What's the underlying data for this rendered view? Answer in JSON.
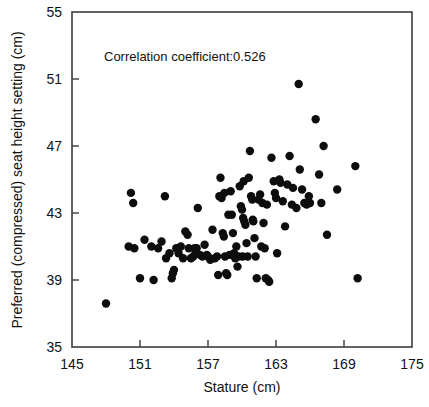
{
  "figure": {
    "annotation": "Correlation coefficient:0.526",
    "background_color": "#ffffff",
    "point_color": "#0d0d0d",
    "axis_color": "#3c3c3c"
  },
  "chart_data": {
    "type": "scatter",
    "title": "",
    "xlabel": "Stature (cm)",
    "ylabel": "Preferred (compressed) seat height setting (cm)",
    "xlim": [
      145,
      175
    ],
    "ylim": [
      35,
      55
    ],
    "xticks": [
      145,
      151,
      157,
      163,
      169,
      175
    ],
    "yticks": [
      35,
      39,
      43,
      47,
      51,
      55
    ],
    "xtick_labels": [
      "145",
      "151",
      "157",
      "163",
      "169",
      "175"
    ],
    "ytick_labels": [
      "35",
      "39",
      "43",
      "47",
      "51",
      "55"
    ],
    "grid": false,
    "legend": null,
    "annotations": [
      {
        "text": "Correlation coefficient:0.526",
        "x": 152.0,
        "y": 52.6
      }
    ],
    "correlation_coefficient": 0.526,
    "marker": {
      "shape": "circle",
      "size_px": 4.2,
      "color": "#0d0d0d"
    },
    "n_points": 118,
    "points": [
      [
        148.0,
        37.6
      ],
      [
        150.2,
        44.2
      ],
      [
        150.4,
        43.6
      ],
      [
        150.0,
        41.0
      ],
      [
        150.5,
        40.9
      ],
      [
        151.0,
        39.1
      ],
      [
        151.4,
        41.4
      ],
      [
        152.0,
        41.0
      ],
      [
        152.2,
        39.0
      ],
      [
        152.6,
        40.9
      ],
      [
        153.2,
        44.0
      ],
      [
        153.3,
        40.3
      ],
      [
        153.6,
        40.6
      ],
      [
        153.8,
        39.1
      ],
      [
        153.9,
        39.4
      ],
      [
        154.2,
        40.9
      ],
      [
        154.4,
        40.6
      ],
      [
        154.6,
        41.0
      ],
      [
        154.8,
        40.3
      ],
      [
        155.0,
        41.9
      ],
      [
        155.2,
        41.7
      ],
      [
        155.3,
        40.9
      ],
      [
        155.5,
        40.3
      ],
      [
        155.7,
        40.4
      ],
      [
        155.9,
        40.6
      ],
      [
        156.1,
        43.3
      ],
      [
        156.3,
        40.5
      ],
      [
        156.5,
        40.4
      ],
      [
        156.7,
        41.1
      ],
      [
        156.9,
        40.5
      ],
      [
        157.2,
        40.2
      ],
      [
        157.4,
        42.0
      ],
      [
        157.6,
        40.3
      ],
      [
        157.8,
        40.4
      ],
      [
        157.9,
        39.3
      ],
      [
        158.0,
        44.0
      ],
      [
        158.1,
        45.1
      ],
      [
        158.2,
        43.9
      ],
      [
        158.3,
        41.8
      ],
      [
        158.4,
        41.6
      ],
      [
        158.5,
        40.4
      ],
      [
        158.6,
        39.4
      ],
      [
        158.7,
        39.3
      ],
      [
        158.9,
        40.5
      ],
      [
        159.0,
        44.3
      ],
      [
        159.1,
        42.9
      ],
      [
        159.2,
        41.8
      ],
      [
        159.3,
        40.6
      ],
      [
        159.4,
        40.3
      ],
      [
        159.6,
        39.8
      ],
      [
        159.8,
        44.6
      ],
      [
        159.9,
        43.4
      ],
      [
        160.0,
        43.2
      ],
      [
        160.1,
        42.7
      ],
      [
        160.2,
        42.5
      ],
      [
        160.3,
        42.3
      ],
      [
        160.4,
        41.2
      ],
      [
        160.5,
        40.4
      ],
      [
        160.6,
        45.1
      ],
      [
        160.7,
        46.7
      ],
      [
        160.8,
        44.0
      ],
      [
        160.9,
        43.8
      ],
      [
        160.95,
        42.6
      ],
      [
        161.0,
        42.5
      ],
      [
        161.1,
        41.5
      ],
      [
        161.2,
        40.4
      ],
      [
        161.3,
        39.1
      ],
      [
        161.6,
        44.1
      ],
      [
        161.8,
        43.6
      ],
      [
        161.9,
        42.4
      ],
      [
        162.0,
        40.9
      ],
      [
        162.1,
        39.1
      ],
      [
        162.3,
        39.0
      ],
      [
        162.4,
        38.9
      ],
      [
        162.6,
        46.3
      ],
      [
        162.8,
        44.9
      ],
      [
        162.9,
        44.2
      ],
      [
        163.0,
        43.9
      ],
      [
        163.1,
        40.6
      ],
      [
        163.4,
        44.8
      ],
      [
        163.6,
        43.7
      ],
      [
        163.8,
        42.2
      ],
      [
        164.0,
        44.7
      ],
      [
        164.2,
        46.4
      ],
      [
        164.5,
        44.5
      ],
      [
        164.8,
        43.3
      ],
      [
        165.0,
        50.7
      ],
      [
        165.1,
        45.6
      ],
      [
        165.3,
        44.4
      ],
      [
        165.5,
        43.6
      ],
      [
        165.7,
        43.5
      ],
      [
        166.0,
        43.6
      ],
      [
        166.5,
        48.6
      ],
      [
        166.8,
        45.3
      ],
      [
        167.0,
        43.6
      ],
      [
        167.2,
        47.0
      ],
      [
        167.5,
        41.7
      ],
      [
        168.4,
        44.4
      ],
      [
        170.0,
        45.8
      ],
      [
        170.2,
        39.1
      ],
      [
        159.5,
        41.0
      ],
      [
        158.8,
        42.9
      ],
      [
        160.05,
        40.4
      ],
      [
        156.0,
        40.9
      ],
      [
        157.0,
        40.4
      ],
      [
        154.0,
        39.6
      ],
      [
        159.7,
        40.4
      ],
      [
        161.45,
        43.8
      ],
      [
        162.2,
        43.5
      ],
      [
        163.3,
        45.0
      ],
      [
        164.4,
        43.5
      ],
      [
        165.9,
        44.0
      ],
      [
        158.45,
        44.2
      ],
      [
        160.15,
        44.9
      ],
      [
        155.8,
        40.9
      ],
      [
        152.9,
        41.3
      ],
      [
        161.7,
        41.0
      ]
    ]
  }
}
